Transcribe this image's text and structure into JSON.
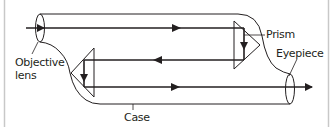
{
  "diagram": {
    "labels": {
      "prism": "Prism",
      "eyepiece": "Eyepiece",
      "objective_line1": "Objective",
      "objective_line2": "lens",
      "case": "Case"
    },
    "colors": {
      "stroke": "#231f20",
      "frame": "#c8c8c8",
      "background": "#ffffff"
    }
  }
}
